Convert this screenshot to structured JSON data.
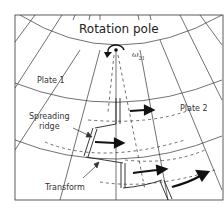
{
  "diagram": {
    "title": "Rotation pole",
    "labels": {
      "plate1": "Plate 1",
      "plate2": "Plate 2",
      "spreading_ridge_line1": "Spreading",
      "spreading_ridge_line2": "ridge",
      "transform": "Transform",
      "omega": "ω",
      "omega_sub": "21"
    },
    "elements": [
      "rotation-pole-marker",
      "rotation-arrow",
      "small-circle-latitude-lines",
      "great-circle-meridians",
      "ridge-segments-double-lines",
      "transform-faults",
      "plate-motion-arrows",
      "dashed-flow-lines"
    ],
    "colors": {
      "line": "#222222",
      "background": "#ffffff"
    }
  }
}
